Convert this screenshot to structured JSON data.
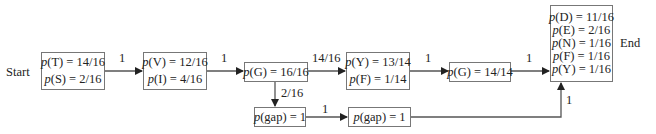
{
  "diagram": {
    "start_label": "Start",
    "end_label": "End",
    "nodes": [
      {
        "id": "n1",
        "lines": [
          {
            "var": "T",
            "value": "14/16"
          },
          {
            "var": "S",
            "value": "2/16"
          }
        ]
      },
      {
        "id": "n2",
        "lines": [
          {
            "var": "V",
            "value": "12/16"
          },
          {
            "var": "I",
            "value": "4/16"
          }
        ]
      },
      {
        "id": "n3",
        "lines": [
          {
            "var": "G",
            "value": "16/16"
          }
        ]
      },
      {
        "id": "n4",
        "lines": [
          {
            "var": "Y",
            "value": "13/14"
          },
          {
            "var": "F",
            "value": "1/14"
          }
        ]
      },
      {
        "id": "n5",
        "lines": [
          {
            "var": "G",
            "value": "14/14"
          }
        ]
      },
      {
        "id": "n6",
        "lines": [
          {
            "var": "D",
            "value": "11/16"
          },
          {
            "var": "E",
            "value": "2/16"
          },
          {
            "var": "N",
            "value": "1/16"
          },
          {
            "var": "F",
            "value": "1/16"
          },
          {
            "var": "Y",
            "value": "1/16"
          }
        ]
      },
      {
        "id": "n7",
        "lines": [
          {
            "var": "gap",
            "value": "1"
          }
        ]
      },
      {
        "id": "n8",
        "lines": [
          {
            "var": "gap",
            "value": "1"
          }
        ]
      }
    ],
    "edges": [
      {
        "from": "n1",
        "to": "n2",
        "label": "1"
      },
      {
        "from": "n2",
        "to": "n3",
        "label": "1"
      },
      {
        "from": "n3",
        "to": "n4",
        "label": "14/16"
      },
      {
        "from": "n4",
        "to": "n5",
        "label": "1"
      },
      {
        "from": "n5",
        "to": "n6",
        "label": "1"
      },
      {
        "from": "n3",
        "to": "n7",
        "label": "2/16"
      },
      {
        "from": "n7",
        "to": "n8",
        "label": "1"
      },
      {
        "from": "n8",
        "to": "n6",
        "label": "1"
      }
    ]
  }
}
